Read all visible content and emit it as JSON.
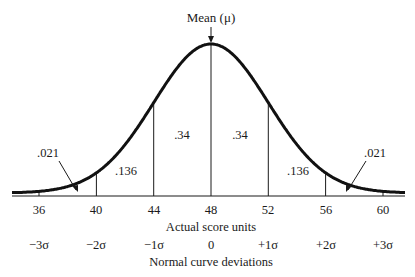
{
  "chart_data": {
    "type": "line",
    "title": "",
    "subtitle": "",
    "annotation_top": "Mean (μ)",
    "xlabel": "Actual score units",
    "xlabel2": "Normal curve deviations",
    "ylabel": "",
    "mean": 48,
    "sd": 4,
    "x_ticks": [
      36,
      40,
      44,
      48,
      52,
      56,
      60
    ],
    "sigma_ticks": [
      "−3σ",
      "−2σ",
      "−1σ",
      "0",
      "+1σ",
      "+2σ",
      "+3σ"
    ],
    "areas": [
      {
        "from": 36,
        "to": 40,
        "value": ".021",
        "label_side": "left-arrow"
      },
      {
        "from": 40,
        "to": 44,
        "value": ".136"
      },
      {
        "from": 44,
        "to": 48,
        "value": ".34"
      },
      {
        "from": 48,
        "to": 52,
        "value": ".34"
      },
      {
        "from": 52,
        "to": 56,
        "value": ".136"
      },
      {
        "from": 56,
        "to": 60,
        "value": ".021",
        "label_side": "right-arrow"
      }
    ],
    "vertical_lines_at": [
      40,
      44,
      48,
      52,
      56
    ],
    "grid": false,
    "legend": "none"
  },
  "labels": {
    "mean": "Mean (μ)",
    "area_left_tail": ".021",
    "area_left_2": ".136",
    "area_left_1": ".34",
    "area_right_1": ".34",
    "area_right_2": ".136",
    "area_right_tail": ".021",
    "x_axis_title": "Actual score units",
    "sigma_axis_title": "Normal curve deviations",
    "x_tick_0": "36",
    "x_tick_1": "40",
    "x_tick_2": "44",
    "x_tick_3": "48",
    "x_tick_4": "52",
    "x_tick_5": "56",
    "x_tick_6": "60",
    "s_tick_0": "−3σ",
    "s_tick_1": "−2σ",
    "s_tick_2": "−1σ",
    "s_tick_3": "0",
    "s_tick_4": "+1σ",
    "s_tick_5": "+2σ",
    "s_tick_6": "+3σ"
  },
  "colors": {
    "ink": "#1a1a1a",
    "background": "#ffffff"
  }
}
